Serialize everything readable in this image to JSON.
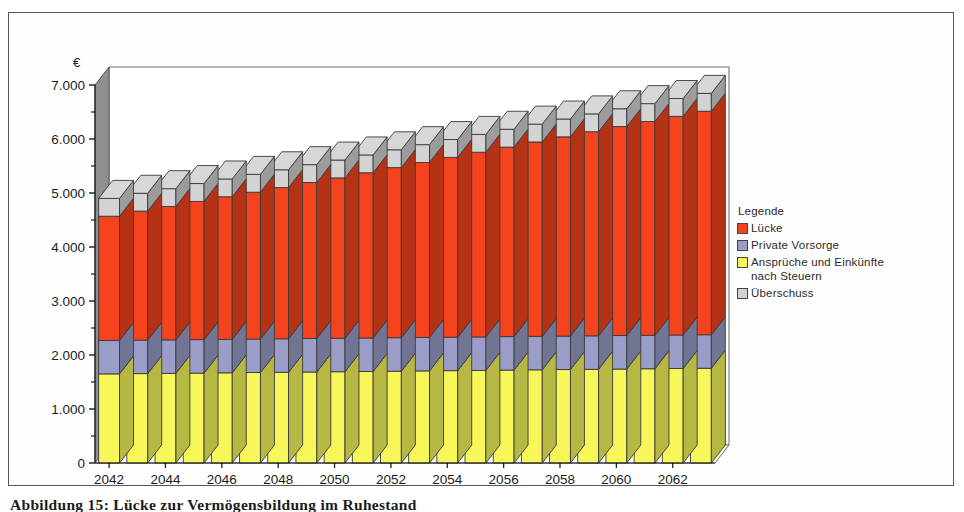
{
  "figure": {
    "caption": "Abbildung 15: Lücke zur Vermögensbildung im Ruhestand"
  },
  "legend": {
    "title": "Legende",
    "position": "right",
    "items": [
      {
        "label": "Lücke",
        "color": "#f5431d"
      },
      {
        "label": "Private Vorsorge",
        "color": "#9a9dc8"
      },
      {
        "label": "Ansprüche und Einkünfte\nnach Steuern",
        "color": "#f7f75a"
      },
      {
        "label": "Überschuss",
        "color": "#d3d3d3"
      }
    ]
  },
  "chart_data": {
    "type": "bar",
    "subtype": "stacked-3d-column",
    "title": "",
    "xlabel": "",
    "ylabel": "€",
    "ylim": [
      0,
      7000
    ],
    "yticks": [
      0,
      1000,
      2000,
      3000,
      4000,
      5000,
      6000,
      7000
    ],
    "ytick_labels": [
      "0",
      "1.000",
      "2.000",
      "3.000",
      "4.000",
      "5.000",
      "6.000",
      "7.000"
    ],
    "yminor_step": 500,
    "grid": false,
    "x_tick_label_step": 2,
    "categories": [
      "2042",
      "2043",
      "2044",
      "2045",
      "2046",
      "2047",
      "2048",
      "2049",
      "2050",
      "2051",
      "2052",
      "2053",
      "2054",
      "2055",
      "2056",
      "2057",
      "2058",
      "2059",
      "2060",
      "2061",
      "2062",
      "2063"
    ],
    "xtick_labels_shown": [
      "2042",
      "2044",
      "2046",
      "2048",
      "2050",
      "2052",
      "2054",
      "2056",
      "2058",
      "2060",
      "2062"
    ],
    "series": [
      {
        "name": "Ansprüche und Einkünfte nach Steuern",
        "color": "#f7f75a",
        "values": [
          1650,
          1655,
          1660,
          1665,
          1670,
          1675,
          1680,
          1685,
          1690,
          1695,
          1700,
          1705,
          1710,
          1715,
          1720,
          1725,
          1730,
          1735,
          1740,
          1745,
          1750,
          1755
        ]
      },
      {
        "name": "Private Vorsorge",
        "color": "#9a9dc8",
        "values": [
          620,
          620,
          620,
          620,
          620,
          620,
          620,
          620,
          620,
          620,
          620,
          620,
          620,
          620,
          620,
          620,
          620,
          620,
          620,
          620,
          620,
          620
        ]
      },
      {
        "name": "Lücke",
        "color": "#f5431d",
        "values": [
          2300,
          2390,
          2470,
          2560,
          2640,
          2720,
          2800,
          2890,
          2970,
          3060,
          3150,
          3240,
          3330,
          3420,
          3510,
          3600,
          3690,
          3780,
          3870,
          3960,
          4050,
          4140
        ]
      },
      {
        "name": "Überschuss",
        "color": "#d3d3d3",
        "values": [
          330,
          330,
          330,
          330,
          330,
          330,
          330,
          330,
          330,
          330,
          330,
          330,
          330,
          330,
          330,
          330,
          330,
          330,
          330,
          330,
          330,
          330
        ]
      }
    ],
    "totals": [
      4900,
      4995,
      5080,
      5175,
      5260,
      5345,
      5430,
      5525,
      5610,
      5705,
      5800,
      5895,
      5990,
      6085,
      6180,
      6275,
      6370,
      6465,
      6560,
      6655,
      6750,
      6845
    ]
  }
}
